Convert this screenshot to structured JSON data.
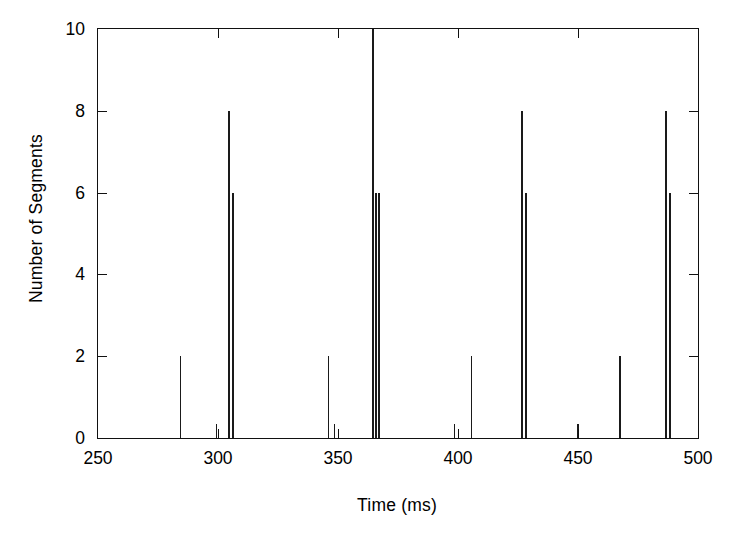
{
  "chart_data": {
    "type": "bar",
    "title": "",
    "subtitle": "",
    "xlabel": "Time (ms)",
    "ylabel": "Number of Segments",
    "xlim": [
      250,
      500
    ],
    "ylim": [
      0,
      10
    ],
    "xticks": [
      250,
      300,
      350,
      400,
      450,
      500
    ],
    "yticks": [
      0,
      2,
      4,
      6,
      8,
      10
    ],
    "xtick_labels": [
      "250",
      "300",
      "350",
      "400",
      "450",
      "500"
    ],
    "ytick_labels": [
      "0",
      "2",
      "4",
      "6",
      "8",
      "10"
    ],
    "grid": false,
    "legend": null,
    "legend_position": "none",
    "series_name": "segment spikes",
    "bar_color": "#1a1a1a",
    "points": [
      {
        "x": 284.5,
        "y": 2
      },
      {
        "x": 299.5,
        "y": 0.35
      },
      {
        "x": 304.5,
        "y": 8
      },
      {
        "x": 306.0,
        "y": 6
      },
      {
        "x": 346.0,
        "y": 2
      },
      {
        "x": 348.5,
        "y": 0.35
      },
      {
        "x": 364.5,
        "y": 10
      },
      {
        "x": 365.8,
        "y": 6
      },
      {
        "x": 366.8,
        "y": 6
      },
      {
        "x": 398.5,
        "y": 0.35
      },
      {
        "x": 405.5,
        "y": 2
      },
      {
        "x": 426.5,
        "y": 8
      },
      {
        "x": 428.0,
        "y": 6
      },
      {
        "x": 450.0,
        "y": 0.35
      },
      {
        "x": 467.5,
        "y": 2
      },
      {
        "x": 486.5,
        "y": 8
      },
      {
        "x": 488.0,
        "y": 6
      }
    ]
  },
  "figure": {
    "background_color": "#ffffff",
    "axis_color": "#111111"
  }
}
